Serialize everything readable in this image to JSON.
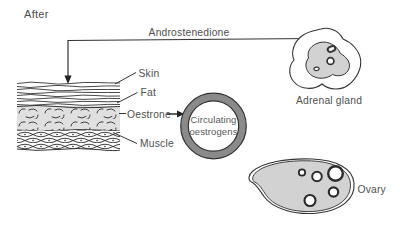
{
  "diagram_title": "After",
  "pathway": {
    "hormone": "Androstenedione",
    "intermediate": "Oestrone"
  },
  "tissue_labels": {
    "skin": "Skin",
    "fat": "Fat",
    "muscle": "Muscle"
  },
  "circulating_pool": {
    "line1": "Circulating",
    "line2": "oestrogens"
  },
  "organs": {
    "adrenal": "Adrenal gland",
    "ovary": "Ovary"
  },
  "colors": {
    "background": "#ffffff",
    "line": "#333333",
    "text": "#4f4f4f",
    "fat_fill": "#e0e0e0",
    "organ_fill": "#d2d2d2",
    "ring_gray": "#8a8a8a"
  }
}
